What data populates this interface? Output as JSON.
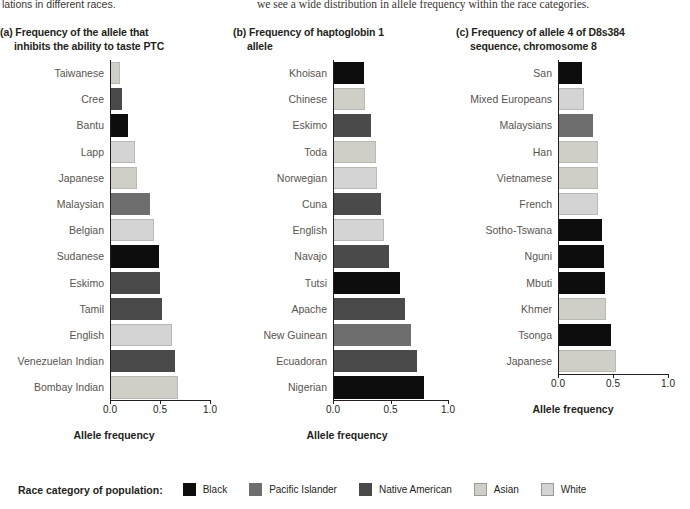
{
  "top_text": {
    "left_fragment": "lations in different races.",
    "right_fragment": "we see a wide distribution in allele frequency within the race categories."
  },
  "axis_title": "Allele frequency",
  "legend": {
    "lead": "Race category of population:",
    "items": [
      {
        "label": "Black",
        "color": "#0d0d0d"
      },
      {
        "label": "Pacific Islander",
        "color": "#6e6e6e"
      },
      {
        "label": "Native American",
        "color": "#4a4a4a"
      },
      {
        "label": "Asian",
        "color": "#cfcfc8"
      },
      {
        "label": "White",
        "color": "#d4d4d4"
      }
    ]
  },
  "chart_data": [
    {
      "type": "bar",
      "panel": "a",
      "title": "(a) Frequency of the allele that",
      "title_line2": "inhibits the ability to taste PTC",
      "orientation": "horizontal",
      "xlabel": "Allele frequency",
      "ylabel": "",
      "xlim": [
        0.0,
        1.0
      ],
      "xticks": [
        "0.0",
        "0.5",
        "1.0"
      ],
      "grid": false,
      "categories": [
        "Taiwanese",
        "Cree",
        "Bantu",
        "Lapp",
        "Japanese",
        "Malaysian",
        "Belgian",
        "Sudanese",
        "Eskimo",
        "Tamil",
        "English",
        "Venezuelan Indian",
        "Bombay Indian"
      ],
      "values": [
        0.1,
        0.12,
        0.18,
        0.25,
        0.27,
        0.4,
        0.44,
        0.49,
        0.5,
        0.52,
        0.62,
        0.65,
        0.68
      ],
      "race": [
        "Asian",
        "Native American",
        "Black",
        "White",
        "Asian",
        "Pacific Islander",
        "White",
        "Black",
        "Native American",
        "Native American",
        "White",
        "Native American",
        "Asian"
      ]
    },
    {
      "type": "bar",
      "panel": "b",
      "title": "(b) Frequency of haptoglobin 1",
      "title_line2": "allele",
      "orientation": "horizontal",
      "xlabel": "Allele frequency",
      "ylabel": "",
      "xlim": [
        0.0,
        1.0
      ],
      "xticks": [
        "0.0",
        "0.5",
        "1.0"
      ],
      "grid": false,
      "categories": [
        "Khoisan",
        "Chinese",
        "Eskimo",
        "Toda",
        "Norwegian",
        "Cuna",
        "English",
        "Navajo",
        "Tutsi",
        "Apache",
        "New Guinean",
        "Ecuadoran",
        "Nigerian"
      ],
      "values": [
        0.27,
        0.28,
        0.33,
        0.37,
        0.38,
        0.42,
        0.44,
        0.49,
        0.58,
        0.63,
        0.68,
        0.73,
        0.79
      ],
      "race": [
        "Black",
        "Asian",
        "Native American",
        "Asian",
        "White",
        "Native American",
        "White",
        "Native American",
        "Black",
        "Native American",
        "Pacific Islander",
        "Native American",
        "Black"
      ]
    },
    {
      "type": "bar",
      "panel": "c",
      "title": "(c) Frequency of allele 4 of D8s384",
      "title_line2": "sequence, chromosome 8",
      "orientation": "horizontal",
      "xlabel": "Allele frequency",
      "ylabel": "",
      "xlim": [
        0.0,
        1.0
      ],
      "xticks": [
        "0.0",
        "0.5",
        "1.0"
      ],
      "grid": false,
      "categories": [
        "San",
        "Mixed Europeans",
        "Malaysians",
        "Han",
        "Vietnamese",
        "French",
        "Sotho-Tswana",
        "Nguni",
        "Mbuti",
        "Khmer",
        "Tsonga",
        "Japanese"
      ],
      "values": [
        0.22,
        0.24,
        0.32,
        0.36,
        0.36,
        0.36,
        0.4,
        0.42,
        0.43,
        0.44,
        0.48,
        0.53
      ],
      "race": [
        "Black",
        "White",
        "Pacific Islander",
        "Asian",
        "Asian",
        "White",
        "Black",
        "Black",
        "Black",
        "Asian",
        "Black",
        "Asian"
      ]
    }
  ]
}
